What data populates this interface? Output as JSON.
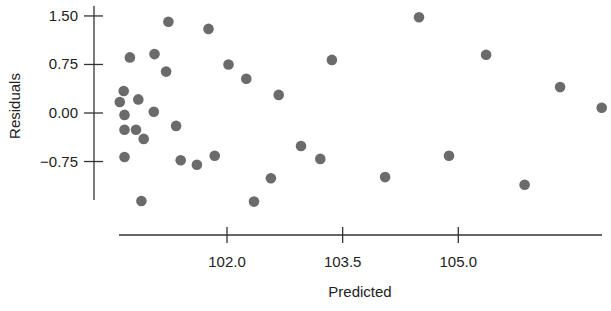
{
  "chart_data": {
    "type": "scatter",
    "title": "",
    "xlabel": "Predicted",
    "ylabel": "Residuals",
    "x_ticks": [
      102.0,
      103.5,
      105.0
    ],
    "x_tick_labels": [
      "102.0",
      "103.5",
      "105.0"
    ],
    "y_ticks": [
      1.5,
      0.75,
      0.0,
      -0.75
    ],
    "y_tick_labels": [
      "1.50",
      "0.75",
      "0.00",
      "−0.75"
    ],
    "xlim": [
      100.6,
      106.9
    ],
    "ylim": [
      -1.4,
      1.55
    ],
    "grid": false,
    "legend": null,
    "marker_color": "#6b6b6b",
    "series": [
      {
        "name": "Residuals vs Predicted",
        "points": [
          {
            "x": 100.61,
            "y": 0.17
          },
          {
            "x": 100.66,
            "y": 0.34
          },
          {
            "x": 100.67,
            "y": -0.03
          },
          {
            "x": 100.67,
            "y": -0.26
          },
          {
            "x": 100.67,
            "y": -0.68
          },
          {
            "x": 100.74,
            "y": 0.86
          },
          {
            "x": 100.82,
            "y": -0.26
          },
          {
            "x": 100.85,
            "y": 0.21
          },
          {
            "x": 100.89,
            "y": -1.36
          },
          {
            "x": 100.92,
            "y": -0.4
          },
          {
            "x": 101.06,
            "y": 0.91
          },
          {
            "x": 101.05,
            "y": 0.02
          },
          {
            "x": 101.21,
            "y": 0.64
          },
          {
            "x": 101.24,
            "y": 1.41
          },
          {
            "x": 101.34,
            "y": -0.2
          },
          {
            "x": 101.4,
            "y": -0.73
          },
          {
            "x": 101.61,
            "y": -0.8
          },
          {
            "x": 101.76,
            "y": 1.3
          },
          {
            "x": 101.84,
            "y": -0.66
          },
          {
            "x": 102.02,
            "y": 0.75
          },
          {
            "x": 102.25,
            "y": 0.53
          },
          {
            "x": 102.35,
            "y": -1.37
          },
          {
            "x": 102.57,
            "y": -1.01
          },
          {
            "x": 102.67,
            "y": 0.28
          },
          {
            "x": 102.96,
            "y": -0.51
          },
          {
            "x": 103.21,
            "y": -0.71
          },
          {
            "x": 103.36,
            "y": 0.82
          },
          {
            "x": 104.05,
            "y": -0.99
          },
          {
            "x": 104.49,
            "y": 1.48
          },
          {
            "x": 104.88,
            "y": -0.66
          },
          {
            "x": 105.36,
            "y": 0.9
          },
          {
            "x": 105.86,
            "y": -1.11
          },
          {
            "x": 106.32,
            "y": 0.4
          },
          {
            "x": 106.86,
            "y": 0.08
          }
        ]
      }
    ]
  },
  "labels": {
    "xlabel": "Predicted",
    "ylabel": "Residuals"
  }
}
